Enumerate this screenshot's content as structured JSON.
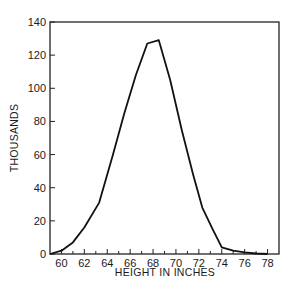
{
  "chart_data": {
    "type": "line",
    "title": "",
    "xlabel": "HEIGHT IN INCHES",
    "ylabel": "THOUSANDS",
    "xlim": [
      59,
      79
    ],
    "ylim": [
      0,
      140
    ],
    "x_ticks": [
      60,
      62,
      64,
      66,
      68,
      70,
      72,
      74,
      76,
      78
    ],
    "x_minor_ticks": [
      61,
      63,
      65,
      67,
      69,
      71,
      73,
      75,
      77
    ],
    "y_ticks": [
      0,
      20,
      40,
      60,
      80,
      100,
      120,
      140
    ],
    "grid": false,
    "legend": null,
    "series": [
      {
        "name": "Height distribution",
        "x": [
          59,
          60,
          61,
          62,
          63.3,
          64.5,
          65.5,
          66.5,
          67.5,
          68.5,
          69.5,
          70.5,
          71.5,
          72.3,
          73.2,
          74,
          75,
          76,
          77,
          78
        ],
        "values": [
          0,
          2,
          7,
          16,
          31,
          60,
          85,
          108,
          127,
          129,
          105,
          75,
          48,
          28,
          15,
          4,
          2,
          1,
          0.3,
          0
        ]
      }
    ]
  },
  "labels": {
    "xlabel": "HEIGHT IN INCHES",
    "ylabel": "THOUSANDS"
  }
}
